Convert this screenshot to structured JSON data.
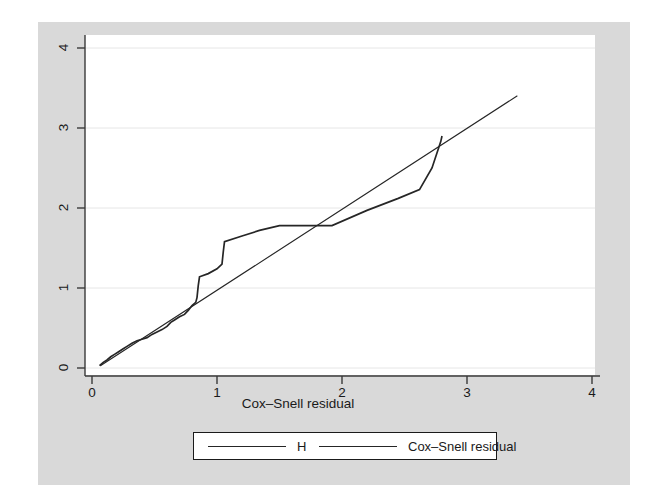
{
  "figure": {
    "background_color": "#d9d9d9",
    "plot_background_color": "#ffffff",
    "line_color": "#262626",
    "grid_color": "#e3e3e3"
  },
  "axes": {
    "x": {
      "title": "Cox–Snell residual",
      "ticks": [
        "0",
        "1",
        "2",
        "3",
        "4"
      ],
      "tick_values": [
        0,
        1,
        2,
        3,
        4
      ],
      "range": [
        0,
        4
      ]
    },
    "y": {
      "title": "",
      "ticks": [
        "0",
        "1",
        "2",
        "3",
        "4"
      ],
      "tick_values": [
        0,
        1,
        2,
        3,
        4
      ],
      "range": [
        0,
        4
      ]
    }
  },
  "legend": {
    "entries": [
      {
        "label": "H",
        "style": "solid-thick"
      },
      {
        "label": "Cox–Snell residual",
        "style": "solid-thin"
      }
    ]
  },
  "chart_data": {
    "type": "line",
    "title": "",
    "subtitle": "",
    "xlabel": "Cox–Snell residual",
    "ylabel": "",
    "xlim": [
      0,
      4
    ],
    "ylim": [
      0,
      4
    ],
    "grid": true,
    "grid_axis": "y",
    "legend_position": "below-plot",
    "series": [
      {
        "name": "H",
        "style": "solid-thick",
        "comment": "Nelson-Aalen cumulative hazard of Cox-Snell residuals (step function)",
        "points": [
          [
            0.06,
            0.03
          ],
          [
            0.09,
            0.07
          ],
          [
            0.12,
            0.1
          ],
          [
            0.15,
            0.14
          ],
          [
            0.18,
            0.17
          ],
          [
            0.21,
            0.2
          ],
          [
            0.25,
            0.24
          ],
          [
            0.28,
            0.27
          ],
          [
            0.32,
            0.31
          ],
          [
            0.36,
            0.34
          ],
          [
            0.4,
            0.36
          ],
          [
            0.44,
            0.38
          ],
          [
            0.48,
            0.42
          ],
          [
            0.52,
            0.45
          ],
          [
            0.56,
            0.48
          ],
          [
            0.6,
            0.52
          ],
          [
            0.63,
            0.57
          ],
          [
            0.66,
            0.6
          ],
          [
            0.7,
            0.64
          ],
          [
            0.74,
            0.67
          ],
          [
            0.77,
            0.72
          ],
          [
            0.8,
            0.78
          ],
          [
            0.83,
            0.82
          ],
          [
            0.84,
            0.88
          ],
          [
            0.85,
            1.03
          ],
          [
            0.86,
            1.14
          ],
          [
            0.93,
            1.18
          ],
          [
            1.0,
            1.24
          ],
          [
            1.04,
            1.3
          ],
          [
            1.05,
            1.45
          ],
          [
            1.06,
            1.58
          ],
          [
            1.2,
            1.65
          ],
          [
            1.34,
            1.72
          ],
          [
            1.5,
            1.78
          ],
          [
            1.7,
            1.78
          ],
          [
            1.92,
            1.78
          ],
          [
            2.2,
            1.97
          ],
          [
            2.45,
            2.12
          ],
          [
            2.62,
            2.23
          ],
          [
            2.72,
            2.5
          ],
          [
            2.79,
            2.83
          ],
          [
            2.8,
            2.9
          ]
        ]
      },
      {
        "name": "Cox–Snell residual",
        "style": "solid-thin",
        "comment": "45-degree reference line y = x",
        "points": [
          [
            0.07,
            0.03
          ],
          [
            3.4,
            3.4
          ]
        ]
      }
    ]
  }
}
